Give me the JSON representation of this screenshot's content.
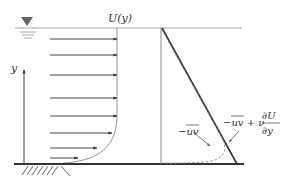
{
  "diagram": {
    "labels": {
      "velocity": "U(y)",
      "y_axis": "y",
      "reynolds_stress": "−uv",
      "total_stress_a": "−uv + ν",
      "total_stress_num": "∂U",
      "total_stress_den": "∂y"
    },
    "colors": {
      "line": "#333333",
      "surface": "#aaaaaa",
      "dashed": "#999999"
    },
    "velocity_arrows": [
      {
        "y": 39,
        "tip_x": 117
      },
      {
        "y": 55,
        "tip_x": 117
      },
      {
        "y": 75,
        "tip_x": 117
      },
      {
        "y": 98,
        "tip_x": 117
      },
      {
        "y": 116,
        "tip_x": 117
      },
      {
        "y": 133,
        "tip_x": 113
      },
      {
        "y": 148,
        "tip_x": 98
      },
      {
        "y": 158,
        "tip_x": 78
      }
    ]
  }
}
